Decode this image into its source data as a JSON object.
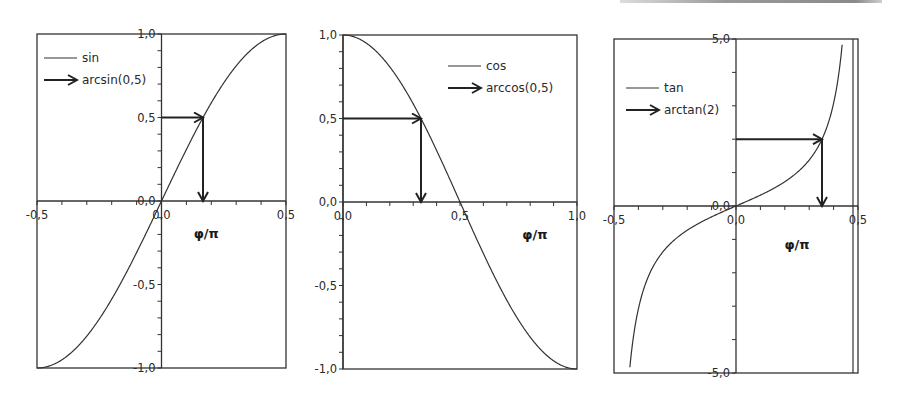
{
  "chart_data": [
    {
      "type": "line",
      "title": "",
      "xlabel": "φ/π",
      "ylabel": "",
      "xlim": [
        -0.5,
        0.5
      ],
      "ylim": [
        -1.0,
        1.0
      ],
      "x_ticks": [
        "-0,5",
        "0,0",
        "0,5"
      ],
      "y_ticks": [
        "1,0",
        "0,5",
        "0,0",
        "-0,5",
        "-1,0"
      ],
      "grid": false,
      "legend": {
        "position": "upper-left",
        "entries": [
          "sin",
          "arcsin(0,5)"
        ]
      },
      "series": [
        {
          "name": "sin",
          "function": "sin(πx)",
          "x": [
            -0.5,
            -0.4,
            -0.3,
            -0.2,
            -0.1,
            0.0,
            0.1,
            0.2,
            0.3,
            0.4,
            0.5
          ],
          "values": [
            -1.0,
            -0.951,
            -0.809,
            -0.588,
            -0.309,
            0.0,
            0.309,
            0.588,
            0.809,
            0.951,
            1.0
          ]
        }
      ],
      "annotations": [
        {
          "name": "arcsin(0,5)",
          "type": "arrow-path",
          "from": [
            0.0,
            0.5
          ],
          "via": [
            0.1667,
            0.5
          ],
          "to": [
            0.1667,
            0.0
          ]
        }
      ]
    },
    {
      "type": "line",
      "title": "",
      "xlabel": "φ/π",
      "ylabel": "",
      "xlim": [
        0.0,
        1.0
      ],
      "ylim": [
        -1.0,
        1.0
      ],
      "x_ticks": [
        "0,0",
        "0,5",
        "1,0"
      ],
      "y_ticks": [
        "1,0",
        "0,5",
        "0,0",
        "-0,5",
        "-1,0"
      ],
      "grid": false,
      "legend": {
        "position": "upper-right",
        "entries": [
          "cos",
          "arccos(0,5)"
        ]
      },
      "series": [
        {
          "name": "cos",
          "function": "cos(πx)",
          "x": [
            0.0,
            0.1,
            0.2,
            0.3,
            0.4,
            0.5,
            0.6,
            0.7,
            0.8,
            0.9,
            1.0
          ],
          "values": [
            1.0,
            0.951,
            0.809,
            0.588,
            0.309,
            0.0,
            -0.309,
            -0.588,
            -0.809,
            -0.951,
            -1.0
          ]
        }
      ],
      "annotations": [
        {
          "name": "arccos(0,5)",
          "type": "arrow-path",
          "from": [
            0.0,
            0.5
          ],
          "via": [
            0.3333,
            0.5
          ],
          "to": [
            0.3333,
            0.0
          ]
        }
      ]
    },
    {
      "type": "line",
      "title": "",
      "xlabel": "φ/π",
      "ylabel": "",
      "xlim": [
        -0.5,
        0.5
      ],
      "ylim": [
        -5.0,
        5.0
      ],
      "x_ticks": [
        "-0,5",
        "0,0",
        "0,5"
      ],
      "y_ticks": [
        "5,0",
        "0,0",
        "-5,0"
      ],
      "grid": false,
      "legend": {
        "position": "upper-left",
        "entries": [
          "tan",
          "arctan(2)"
        ]
      },
      "series": [
        {
          "name": "tan",
          "function": "tan(πx)",
          "x": [
            -0.437,
            -0.4,
            -0.3,
            -0.2,
            -0.1,
            0.0,
            0.1,
            0.2,
            0.3,
            0.4,
            0.437
          ],
          "values": [
            -5.0,
            -3.078,
            -1.376,
            -0.727,
            -0.325,
            0.0,
            0.325,
            0.727,
            1.376,
            3.078,
            5.0
          ]
        }
      ],
      "annotations": [
        {
          "name": "arctan(2)",
          "type": "arrow-path",
          "from": [
            0.0,
            2.0
          ],
          "via": [
            0.3524,
            2.0
          ],
          "to": [
            0.3524,
            0.0
          ]
        }
      ]
    }
  ],
  "charts": [
    {
      "id": "sin",
      "frame": {
        "left": 37,
        "right": 286,
        "top": 34,
        "bottom": 368
      },
      "xlim": [
        -0.5,
        0.5
      ],
      "ylim": [
        -1.0,
        1.0
      ],
      "func": "sin",
      "y_minor_step": 0.1,
      "x_minor_step": 0.1,
      "x_tick_labels": [
        {
          "v": -0.5,
          "text": "-0,5"
        },
        {
          "v": 0.0,
          "text": "0,0"
        },
        {
          "v": 0.5,
          "text": "0,5"
        }
      ],
      "y_tick_labels": [
        {
          "v": 1.0,
          "text": "1,0"
        },
        {
          "v": 0.5,
          "text": "0,5"
        },
        {
          "v": 0.0,
          "text": "0,0"
        },
        {
          "v": -0.5,
          "text": "-0,5"
        },
        {
          "v": -1.0,
          "text": "-1,0"
        }
      ],
      "xlabel": "φ/π",
      "xlabel_pos": [
        0.18,
        -0.22
      ],
      "legend": {
        "x": 44,
        "y": 58,
        "line_label": "sin",
        "arrow_label": "arcsin(0,5)"
      },
      "arrow": {
        "y": 0.5,
        "x": 0.1667
      }
    },
    {
      "id": "cos",
      "frame": {
        "left": 343,
        "right": 577,
        "top": 35,
        "bottom": 369
      },
      "xlim": [
        0.0,
        1.0
      ],
      "ylim": [
        -1.0,
        1.0
      ],
      "func": "cos",
      "y_minor_step": 0.1,
      "x_minor_step": 0.1,
      "x_tick_labels": [
        {
          "v": 0.0,
          "text": "0,0"
        },
        {
          "v": 0.5,
          "text": "0,5"
        },
        {
          "v": 1.0,
          "text": "1,0"
        }
      ],
      "y_tick_labels": [
        {
          "v": 1.0,
          "text": "1,0"
        },
        {
          "v": 0.5,
          "text": "0,5"
        },
        {
          "v": 0.0,
          "text": "0,0"
        },
        {
          "v": -0.5,
          "text": "-0,5"
        },
        {
          "v": -1.0,
          "text": "-1,0"
        }
      ],
      "xlabel": "φ/π",
      "xlabel_pos": [
        0.82,
        -0.22
      ],
      "legend": {
        "x": 448,
        "y": 66,
        "line_label": "cos",
        "arrow_label": "arccos(0,5)"
      },
      "arrow": {
        "y": 0.5,
        "x": 0.3333
      }
    },
    {
      "id": "tan",
      "frame": {
        "left": 614,
        "right": 858,
        "top": 39,
        "bottom": 373
      },
      "inner_right": 853,
      "xlim": [
        -0.5,
        0.5
      ],
      "ylim": [
        -5.0,
        5.0
      ],
      "func": "tan",
      "y_minor_step": 1.0,
      "x_minor_step": 0.1,
      "x_tick_labels": [
        {
          "v": -0.5,
          "text": "-0,5"
        },
        {
          "v": 0.0,
          "text": "0,0"
        },
        {
          "v": 0.5,
          "text": "0,5"
        }
      ],
      "y_tick_labels": [
        {
          "v": 5.0,
          "text": "5,0"
        },
        {
          "v": 0.0,
          "text": "0,0"
        },
        {
          "v": -5.0,
          "text": "-5,0"
        }
      ],
      "xlabel": "φ/π",
      "xlabel_pos": [
        0.25,
        -1.3
      ],
      "legend": {
        "x": 626,
        "y": 88,
        "line_label": "tan",
        "arrow_label": "arctan(2)"
      },
      "arrow": {
        "y": 2.0,
        "x": 0.3524
      }
    }
  ],
  "colors": {
    "line": "#333333",
    "frame": "#333333",
    "text": "#2a2a2a",
    "background": "#ffffff"
  }
}
